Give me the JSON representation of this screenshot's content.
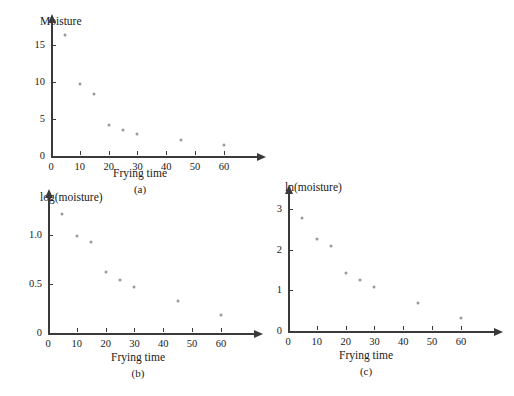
{
  "figure": {
    "background_color": "#ffffff",
    "axis_color": "#3a3a3a",
    "marker_color": "#9a9a9a",
    "text_color": "#1a1a1a"
  },
  "chart_data": [
    {
      "id": "a",
      "type": "scatter",
      "title": "",
      "caption": "(a)",
      "xlabel": "Frying time",
      "ylabel": "Moisture",
      "x": [
        5,
        10,
        15,
        20,
        25,
        30,
        45,
        60
      ],
      "values": [
        16.3,
        9.7,
        8.4,
        4.2,
        3.5,
        3.0,
        2.1,
        1.5
      ],
      "xticks": [
        0,
        10,
        20,
        30,
        40,
        50,
        60
      ],
      "xticklabels": [
        "0",
        "10",
        "20",
        "30",
        "40",
        "50",
        "60"
      ],
      "yticks": [
        0,
        5,
        10,
        15
      ],
      "yticklabels": [
        "0",
        "5",
        "10",
        "15"
      ],
      "xlim": [
        0,
        68
      ],
      "ylim": [
        0,
        17
      ],
      "grid": false,
      "legend": "none"
    },
    {
      "id": "b",
      "type": "scatter",
      "title": "",
      "caption": "(b)",
      "xlabel": "Frying time",
      "ylabel": "log(moisture)",
      "x": [
        5,
        10,
        15,
        20,
        25,
        30,
        45,
        60
      ],
      "values": [
        1.21,
        0.99,
        0.92,
        0.62,
        0.54,
        0.47,
        0.32,
        0.18
      ],
      "xticks": [
        0,
        10,
        20,
        30,
        40,
        50,
        60
      ],
      "xticklabels": [
        "0",
        "10",
        "20",
        "30",
        "40",
        "50",
        "60"
      ],
      "yticks": [
        0,
        0.5,
        1.0
      ],
      "yticklabels": [
        "0",
        "0.5",
        "1.0"
      ],
      "xlim": [
        0,
        68
      ],
      "ylim": [
        0,
        1.3
      ],
      "grid": false,
      "legend": "none"
    },
    {
      "id": "c",
      "type": "scatter",
      "title": "",
      "caption": "(c)",
      "xlabel": "Frying time",
      "ylabel": "ln(moisture)",
      "x": [
        5,
        10,
        15,
        20,
        25,
        30,
        45,
        60
      ],
      "values": [
        2.79,
        2.27,
        2.09,
        1.44,
        1.25,
        1.09,
        0.7,
        0.31
      ],
      "xticks": [
        0,
        10,
        20,
        30,
        40,
        50,
        60
      ],
      "xticklabels": [
        "0",
        "10",
        "20",
        "30",
        "40",
        "50",
        "60"
      ],
      "yticks": [
        0,
        1,
        2,
        3
      ],
      "yticklabels": [
        "0",
        "1",
        "2",
        "3"
      ],
      "xlim": [
        0,
        68
      ],
      "ylim": [
        0,
        3.2
      ],
      "grid": false,
      "legend": "none"
    }
  ]
}
